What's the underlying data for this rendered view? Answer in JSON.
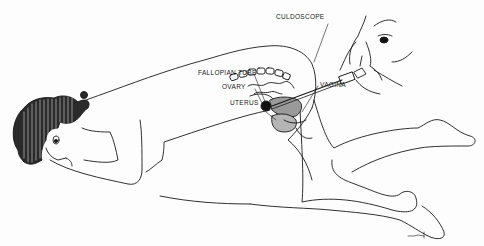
{
  "figure": {
    "type": "medical-illustration",
    "line_color": "#1a1a1a",
    "background": "#fdfdfd"
  },
  "labels": {
    "culdoscope": "CULDOSCOPE",
    "fallopian_tube": "FALLOPIAN TUBE",
    "ovary": "OVARY",
    "uterus": "UTERUS",
    "vagina": "VAGINA"
  }
}
